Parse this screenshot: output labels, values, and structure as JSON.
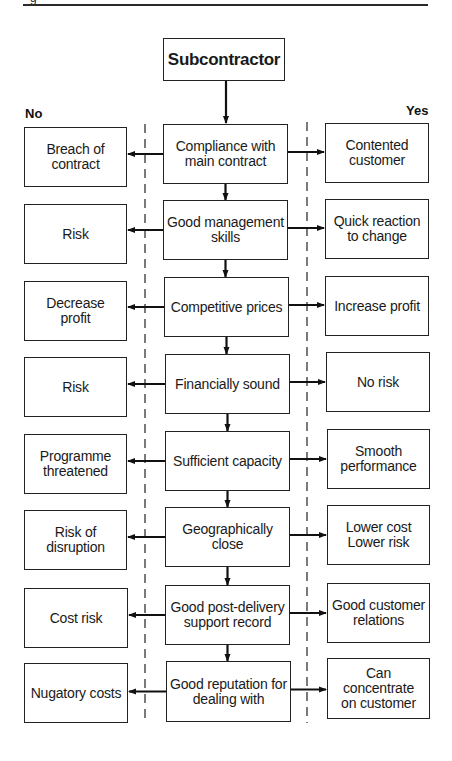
{
  "caption_fragment": "g",
  "header": {
    "root": "Subcontractor"
  },
  "labels": {
    "no": "No",
    "yes": "Yes"
  },
  "rows": [
    {
      "criterion": "Compliance with\nmain contract",
      "no": "Breach of\ncontract",
      "yes": "Contented\ncustomer"
    },
    {
      "criterion": "Good management\nskills",
      "no": "Risk",
      "yes": "Quick reaction\nto change"
    },
    {
      "criterion": "Competitive prices",
      "no": "Decrease\nprofit",
      "yes": "Increase profit"
    },
    {
      "criterion": "Financially sound",
      "no": "Risk",
      "yes": "No risk"
    },
    {
      "criterion": "Sufficient capacity",
      "no": "Programme\nthreatened",
      "yes": "Smooth\nperformance"
    },
    {
      "criterion": "Geographically\nclose",
      "no": "Risk of\ndisruption",
      "yes": "Lower cost\nLower risk"
    },
    {
      "criterion": "Good post-delivery\nsupport record",
      "no": "Cost risk",
      "yes": "Good customer\nrelations"
    },
    {
      "criterion": "Good reputation for\ndealing with",
      "no": "Nugatory costs",
      "yes": "Can concentrate\non customer"
    }
  ],
  "colors": {
    "line": "#222222",
    "background": "#ffffff",
    "text": "#1a1a1a"
  }
}
